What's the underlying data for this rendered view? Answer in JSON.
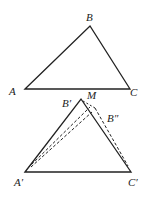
{
  "diagram": {
    "top_triangle": {
      "vertices": {
        "A": {
          "label": "A",
          "x": 25,
          "y": 89
        },
        "B": {
          "label": "B",
          "x": 90,
          "y": 26
        },
        "C": {
          "label": "C",
          "x": 130,
          "y": 89
        }
      }
    },
    "bottom_triangle": {
      "vertices": {
        "A_prime": {
          "label": "A′",
          "x": 25,
          "y": 172
        },
        "B_prime": {
          "label": "B′",
          "x": 81,
          "y": 99
        },
        "C_prime": {
          "label": "C′",
          "x": 131,
          "y": 172
        }
      },
      "points": {
        "M": {
          "label": "M"
        },
        "B_double_prime": {
          "label": "B″",
          "x": 94,
          "y": 108
        }
      }
    },
    "colors": {
      "stroke": "#222222",
      "background": "#ffffff"
    }
  }
}
